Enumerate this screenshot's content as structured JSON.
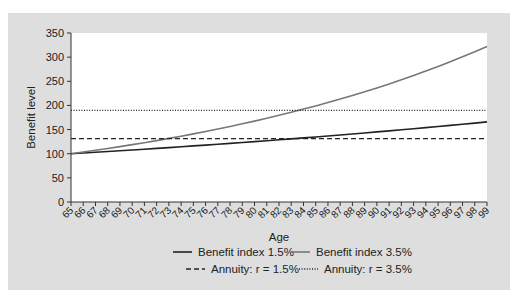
{
  "chart_data": {
    "type": "line",
    "title": "",
    "xlabel": "Age",
    "ylabel": "Benefit level",
    "xlim": [
      65,
      99
    ],
    "ylim": [
      0,
      350
    ],
    "yticks": [
      0,
      50,
      100,
      150,
      200,
      250,
      300,
      350
    ],
    "x": [
      65,
      66,
      67,
      68,
      69,
      70,
      71,
      72,
      73,
      74,
      75,
      76,
      77,
      78,
      79,
      80,
      81,
      82,
      83,
      84,
      85,
      86,
      87,
      88,
      89,
      90,
      91,
      92,
      93,
      94,
      95,
      96,
      97,
      98,
      99
    ],
    "grid": false,
    "legend_position": "bottom",
    "series": [
      {
        "name": "Benefit index 1.5%",
        "style": "solid",
        "color": "#222222",
        "values": [
          100,
          101.5,
          103.0,
          104.6,
          106.1,
          107.7,
          109.3,
          111.0,
          112.6,
          114.3,
          116.1,
          117.8,
          119.6,
          121.4,
          123.2,
          125.0,
          126.9,
          128.8,
          130.7,
          132.7,
          134.7,
          136.7,
          138.8,
          140.8,
          142.9,
          145.1,
          147.3,
          149.5,
          151.7,
          154.0,
          156.3,
          158.7,
          161.1,
          163.5,
          165.9
        ]
      },
      {
        "name": "Benefit index 3.5%",
        "style": "solid",
        "color": "#777777",
        "values": [
          100,
          103.5,
          107.1,
          110.9,
          114.8,
          118.8,
          122.9,
          127.2,
          131.7,
          136.3,
          141.1,
          146.0,
          151.1,
          156.4,
          161.9,
          167.5,
          173.4,
          179.5,
          185.8,
          192.3,
          199.0,
          206.0,
          213.2,
          220.7,
          228.4,
          236.3,
          244.6,
          253.2,
          262.0,
          271.2,
          280.7,
          290.5,
          300.7,
          311.2,
          322.1
        ]
      },
      {
        "name": "Annuity: r = 1.5%",
        "style": "dashed",
        "color": "#222222",
        "values": [
          131,
          131,
          131,
          131,
          131,
          131,
          131,
          131,
          131,
          131,
          131,
          131,
          131,
          131,
          131,
          131,
          131,
          131,
          131,
          131,
          131,
          131,
          131,
          131,
          131,
          131,
          131,
          131,
          131,
          131,
          131,
          131,
          131,
          131,
          131
        ]
      },
      {
        "name": "Annuity: r = 3.5%",
        "style": "dotted",
        "color": "#222222",
        "values": [
          190,
          190,
          190,
          190,
          190,
          190,
          190,
          190,
          190,
          190,
          190,
          190,
          190,
          190,
          190,
          190,
          190,
          190,
          190,
          190,
          190,
          190,
          190,
          190,
          190,
          190,
          190,
          190,
          190,
          190,
          190,
          190,
          190,
          190,
          190
        ]
      }
    ]
  },
  "legend": {
    "rows": [
      [
        {
          "label": "Benefit index 1.5%",
          "series": 0
        },
        {
          "label": "Benefit index 3.5%",
          "series": 1
        }
      ],
      [
        {
          "label": "Annuity: r = 1.5%",
          "series": 2
        },
        {
          "label": "Annuity: r = 3.5%",
          "series": 3
        }
      ]
    ]
  },
  "colors": {
    "panel_bg": "#dedede",
    "plot_bg": "#ffffff",
    "axis": "#333333"
  }
}
